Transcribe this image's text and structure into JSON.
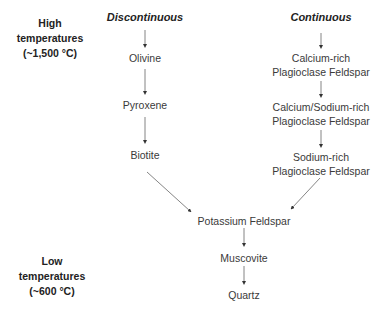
{
  "temperature_labels": {
    "high": {
      "line1": "High",
      "line2": "temperatures",
      "line3": "(~1,500 °C)"
    },
    "low": {
      "line1": "Low",
      "line2": "temperatures",
      "line3": "(~600 °C)"
    }
  },
  "series": {
    "discontinuous": {
      "title": "Discontinuous",
      "minerals": [
        "Olivine",
        "Pyroxene",
        "Biotite"
      ]
    },
    "continuous": {
      "title": "Continuous",
      "minerals": [
        {
          "line1": "Calcium-rich",
          "line2": "Plagioclase Feldspar"
        },
        {
          "line1": "Calcium/Sodium-rich",
          "line2": "Plagioclase Feldspar"
        },
        {
          "line1": "Sodium-rich",
          "line2": "Plagioclase Feldspar"
        }
      ]
    },
    "merged": {
      "minerals": [
        "Potassium Feldspar",
        "Muscovite",
        "Quartz"
      ]
    }
  },
  "colors": {
    "text": "#3a3a3a",
    "heading": "#222222",
    "arrow": "#555555"
  }
}
